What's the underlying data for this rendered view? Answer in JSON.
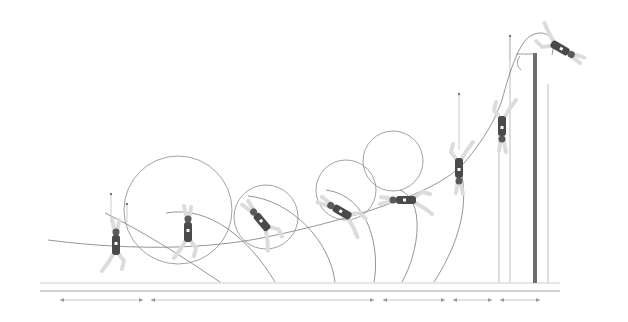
{
  "diagram": {
    "title": "",
    "colors": {
      "background": "#ffffff",
      "lines": "#8a8a8a",
      "athlete_body": "#4a4a4a",
      "athlete_limbs": "#dcdcdc",
      "upright": "#6d6d6d",
      "ground": "#cfcfcf"
    },
    "ground": {
      "y_top": 283,
      "y_bottom": 291,
      "x_start": 40,
      "x_end": 560
    },
    "dimension_segments": [
      {
        "x1": 60,
        "x2": 143
      },
      {
        "x1": 151,
        "x2": 374
      },
      {
        "x1": 383,
        "x2": 445
      },
      {
        "x1": 453,
        "x2": 492
      },
      {
        "x1": 500,
        "x2": 540
      }
    ],
    "dimension_y": 300,
    "bar": {
      "upright_x": 535,
      "upright_top": 53,
      "upright_bottom": 283,
      "upright_width": 4,
      "crossbar_y": 54
    },
    "standards": [
      {
        "x": 499,
        "y1": 113,
        "y2": 283
      },
      {
        "x": 510,
        "y1": 36,
        "y2": 283
      },
      {
        "x": 548,
        "y1": 84,
        "y2": 283
      }
    ],
    "circles": [
      {
        "cx": 178,
        "cy": 210,
        "r": 54
      },
      {
        "cx": 266,
        "cy": 217,
        "r": 32
      },
      {
        "cx": 346,
        "cy": 190,
        "r": 30
      },
      {
        "cx": 393,
        "cy": 161,
        "r": 30
      }
    ],
    "phases": [
      {
        "name": "take-off",
        "x": 116,
        "y": 245,
        "angle": 0
      },
      {
        "name": "pole-plant",
        "x": 188,
        "y": 232,
        "angle": 0
      },
      {
        "name": "swing",
        "x": 262,
        "y": 222,
        "angle": -40
      },
      {
        "name": "rock-back",
        "x": 342,
        "y": 212,
        "angle": -60
      },
      {
        "name": "extension",
        "x": 406,
        "y": 200,
        "angle": -90
      },
      {
        "name": "pull-turn",
        "x": 459,
        "y": 168,
        "angle": 180
      },
      {
        "name": "push-off",
        "x": 502,
        "y": 126,
        "angle": 180
      },
      {
        "name": "bar-clearance",
        "x": 560,
        "y": 48,
        "angle": 120
      }
    ],
    "vertical_markers": [
      {
        "x": 111,
        "y1": 194,
        "y2": 222
      },
      {
        "x": 127,
        "y1": 204,
        "y2": 222
      },
      {
        "x": 459,
        "y1": 94,
        "y2": 150
      },
      {
        "x": 510,
        "y1": 36,
        "y2": 60
      }
    ]
  }
}
